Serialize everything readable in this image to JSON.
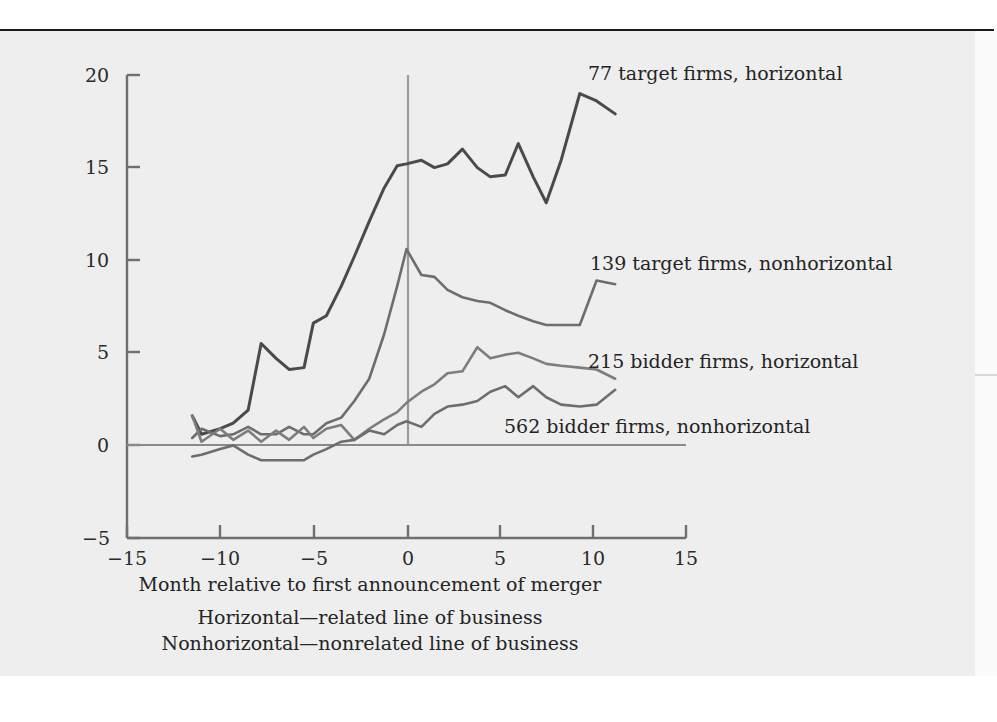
{
  "figure": {
    "ylabel": "Percent cumulative average abnormal returns",
    "xlabel": "Month relative to first announcement of merger",
    "note_line_1": "Horizontal—related line of business",
    "note_line_2": "Nonhorizontal—nonrelated line of business",
    "colors": {
      "background": "#eeeeee",
      "page": "#ffffff",
      "axis": "#6f6f6f",
      "rule": "#1b1b1b",
      "series_dark": "#4a4a4a",
      "series_mid": "#6d6d6d",
      "series_light": "#7d7d7d"
    }
  },
  "labels": {
    "target_horizontal": "77 target firms, horizontal",
    "target_nonhorizontal": "139 target firms, nonhorizontal",
    "bidder_horizontal": "215 bidder firms, horizontal",
    "bidder_nonhorizontal": "562 bidder firms, nonhorizontal"
  },
  "axis_ticks": {
    "y": [
      "20",
      "15",
      "10",
      "5",
      "0",
      "−5"
    ],
    "x": [
      "−15",
      "−10",
      "−5",
      "0",
      "5",
      "10",
      "15"
    ]
  },
  "chart_data": {
    "type": "line",
    "title": "",
    "xlabel": "Month relative to first announcement of merger",
    "ylabel": "Percent cumulative average abnormal returns",
    "xlim": [
      -15,
      15
    ],
    "ylim": [
      -5,
      20
    ],
    "xticks": [
      -15,
      -10,
      -5,
      0,
      5,
      10,
      15
    ],
    "yticks": [
      -5,
      0,
      5,
      10,
      15,
      20
    ],
    "grid": false,
    "legend": "inline-annotations",
    "zero_line": true,
    "event_line_x": 0,
    "series": [
      {
        "name": "77 target firms, horizontal",
        "color": "#4a4a4a",
        "x": [
          -11.5,
          -11,
          -10,
          -9.3,
          -8.5,
          -7.8,
          -7,
          -6.3,
          -5.5,
          -5,
          -4.3,
          -3.5,
          -2.8,
          -2,
          -1.2,
          -0.5,
          0,
          0.8,
          1.5,
          2.2,
          3,
          3.8,
          4.5,
          5.3,
          6,
          6.8,
          7.5,
          8.3,
          9.3,
          10.2,
          11.2
        ],
        "y": [
          1.6,
          0.6,
          0.9,
          1.2,
          1.9,
          5.5,
          4.7,
          4.1,
          4.2,
          6.6,
          7.0,
          8.6,
          10.2,
          12.1,
          13.9,
          15.1,
          15.2,
          15.4,
          15.0,
          15.2,
          16.0,
          15.0,
          14.5,
          14.6,
          16.3,
          14.5,
          13.1,
          15.4,
          19.0,
          18.6,
          17.9
        ]
      },
      {
        "name": "139 target firms, nonhorizontal",
        "color": "#6d6d6d",
        "x": [
          -11.5,
          -11,
          -10,
          -9.3,
          -8.5,
          -7.8,
          -7,
          -6.3,
          -5.5,
          -5,
          -4.3,
          -3.5,
          -2.8,
          -2,
          -1.2,
          -0.5,
          0,
          0.8,
          1.5,
          2.2,
          3,
          3.8,
          4.5,
          5.3,
          6,
          6.8,
          7.5,
          8.3,
          9.3,
          10.2,
          11.2
        ],
        "y": [
          0.4,
          0.9,
          0.5,
          0.6,
          1.0,
          0.6,
          0.6,
          1.0,
          0.6,
          0.6,
          1.2,
          1.5,
          2.4,
          3.6,
          6.0,
          8.6,
          10.6,
          9.2,
          9.1,
          8.4,
          8.0,
          7.8,
          7.7,
          7.3,
          7.0,
          6.7,
          6.5,
          6.5,
          6.5,
          8.9,
          8.7
        ]
      },
      {
        "name": "215 bidder firms, horizontal",
        "color": "#7d7d7d",
        "x": [
          -11.5,
          -11,
          -10,
          -9.3,
          -8.5,
          -7.8,
          -7,
          -6.3,
          -5.5,
          -5,
          -4.3,
          -3.5,
          -2.8,
          -2,
          -1.2,
          -0.5,
          0,
          0.8,
          1.5,
          2.2,
          3,
          3.8,
          4.5,
          5.3,
          6,
          6.8,
          7.5,
          8.3,
          9.3,
          10.2,
          11.2
        ],
        "y": [
          1.6,
          0.2,
          0.9,
          0.3,
          0.8,
          0.2,
          0.8,
          0.3,
          1.0,
          0.4,
          0.9,
          1.1,
          0.3,
          0.9,
          1.4,
          1.8,
          2.3,
          2.9,
          3.3,
          3.9,
          4.0,
          5.3,
          4.7,
          4.9,
          5.0,
          4.7,
          4.4,
          4.3,
          4.2,
          4.1,
          3.6
        ]
      },
      {
        "name": "562 bidder firms, nonhorizontal",
        "color": "#6d6d6d",
        "x": [
          -11.5,
          -11,
          -10,
          -9.3,
          -8.5,
          -7.8,
          -7,
          -6.3,
          -5.5,
          -5,
          -4.3,
          -3.5,
          -2.8,
          -2,
          -1.2,
          -0.5,
          0,
          0.8,
          1.5,
          2.2,
          3,
          3.8,
          4.5,
          5.3,
          6,
          6.8,
          7.5,
          8.3,
          9.3,
          10.2,
          11.2
        ],
        "y": [
          -0.6,
          -0.5,
          -0.2,
          0.0,
          -0.5,
          -0.8,
          -0.8,
          -0.8,
          -0.8,
          -0.5,
          -0.2,
          0.2,
          0.3,
          0.8,
          0.6,
          1.1,
          1.3,
          1.0,
          1.7,
          2.1,
          2.2,
          2.4,
          2.9,
          3.2,
          2.6,
          3.2,
          2.6,
          2.2,
          2.1,
          2.2,
          3.0
        ]
      }
    ]
  }
}
